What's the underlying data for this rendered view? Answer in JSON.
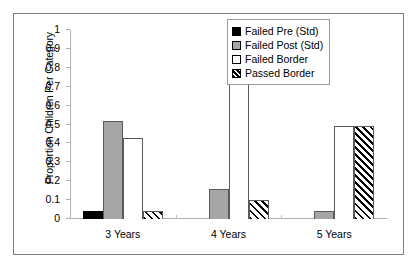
{
  "chart_data": {
    "type": "bar",
    "title": "",
    "xlabel": "",
    "ylabel": "Proportion Children Per Category",
    "ylim": [
      0,
      1
    ],
    "ytick_labels": [
      "1",
      "0.9",
      "0.8",
      "0.7",
      "0.6",
      "0.5",
      "0.4",
      "0.3",
      "0.2",
      "0.1",
      "0"
    ],
    "ytick_values": [
      1,
      0.9,
      0.8,
      0.7,
      0.6,
      0.5,
      0.4,
      0.3,
      0.2,
      0.1,
      0
    ],
    "categories": [
      "3 Years",
      "4 Years",
      "5 Years"
    ],
    "grid": false,
    "legend_position": "top-right",
    "series": [
      {
        "name": "Failed Pre (Std)",
        "style": "black",
        "color": "#000000",
        "values": [
          0.04,
          0,
          0
        ]
      },
      {
        "name": "Failed Post (Std)",
        "style": "gray",
        "color": "#a6a6a6",
        "values": [
          0.52,
          0.16,
          0.04
        ]
      },
      {
        "name": "Failed Border",
        "style": "white",
        "color": "#ffffff",
        "values": [
          0.43,
          0.74,
          0.49
        ]
      },
      {
        "name": "Passed Border",
        "style": "hatch",
        "color": "#ffffff",
        "values": [
          0.04,
          0.1,
          0.49
        ]
      }
    ]
  }
}
